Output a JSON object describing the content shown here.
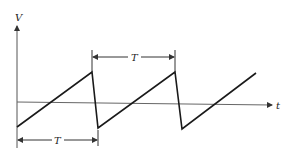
{
  "diagram": {
    "type": "sawtooth-waveform",
    "y_axis_label": "V",
    "x_axis_label": "t",
    "period_label_top": "T",
    "period_label_bottom": "T",
    "colors": {
      "line": "#1a1a1a",
      "axis": "#555555",
      "background": "#ffffff"
    }
  }
}
